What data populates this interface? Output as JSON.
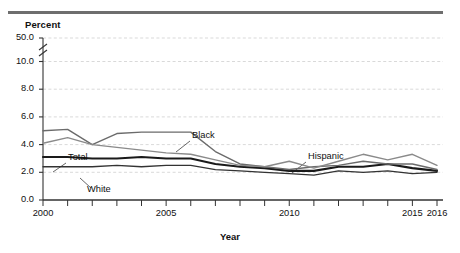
{
  "chart_data": {
    "type": "line",
    "title": "",
    "xlabel": "Year",
    "ylabel": "Percent",
    "ylim": [
      0.0,
      10.0
    ],
    "y_ticks": [
      "0.0",
      "2.0",
      "4.0",
      "6.0",
      "8.0",
      "10.0",
      "50.0"
    ],
    "axis_break": true,
    "axis_break_note": "Y axis broken between 10.0 and 50.0",
    "grid": "horizontal dashed",
    "legend": "inline data labels",
    "x": [
      2000,
      2001,
      2002,
      2003,
      2004,
      2005,
      2006,
      2007,
      2008,
      2009,
      2010,
      2011,
      2012,
      2013,
      2014,
      2015,
      2016
    ],
    "x_tick_labels": [
      "2000",
      "2005",
      "2010",
      "2015",
      "2016"
    ],
    "series": [
      {
        "name": "Total",
        "color": "#1a1a1a",
        "width": 2.1,
        "values": [
          3.1,
          3.1,
          3.0,
          3.0,
          3.1,
          3.0,
          3.0,
          2.6,
          2.4,
          2.3,
          2.1,
          2.1,
          2.4,
          2.4,
          2.6,
          2.3,
          2.1
        ]
      },
      {
        "name": "White",
        "color": "#333333",
        "width": 1.3,
        "values": [
          2.4,
          2.4,
          2.4,
          2.5,
          2.4,
          2.5,
          2.5,
          2.2,
          2.1,
          2.0,
          1.9,
          1.8,
          2.1,
          2.0,
          2.1,
          1.9,
          2.0
        ]
      },
      {
        "name": "Black",
        "color": "#6b6b6b",
        "width": 1.4,
        "values": [
          5.0,
          5.1,
          4.0,
          4.8,
          4.9,
          4.9,
          4.9,
          3.5,
          2.6,
          2.4,
          2.2,
          2.4,
          2.5,
          2.8,
          2.6,
          2.6,
          2.2
        ]
      },
      {
        "name": "Hispanic",
        "color": "#8a8a8a",
        "width": 1.4,
        "values": [
          4.1,
          4.5,
          4.0,
          3.8,
          3.6,
          3.4,
          3.3,
          2.9,
          2.5,
          2.4,
          2.8,
          2.3,
          2.8,
          3.3,
          2.9,
          3.3,
          2.5
        ]
      }
    ],
    "annotations": [
      {
        "label": "Black",
        "x": 192,
        "y": 136
      },
      {
        "label": "Hispanic",
        "x": 308,
        "y": 157
      },
      {
        "label": "Total",
        "x": 68,
        "y": 158
      },
      {
        "label": "White",
        "x": 87,
        "y": 190
      }
    ]
  }
}
